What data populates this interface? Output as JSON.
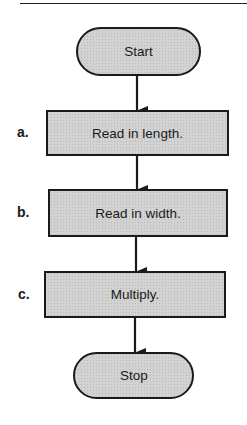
{
  "diagram": {
    "type": "flowchart",
    "colors": {
      "fill": "#cfcfcf",
      "stroke": "#1a1a1a",
      "text": "#1a1a1a"
    },
    "nodes": [
      {
        "id": "start",
        "shape": "terminal",
        "text": "Start"
      },
      {
        "id": "a",
        "shape": "process",
        "label": "a.",
        "text": "Read in length."
      },
      {
        "id": "b",
        "shape": "process",
        "label": "b.",
        "text": "Read in width."
      },
      {
        "id": "c",
        "shape": "process",
        "label": "c.",
        "text": "Multiply."
      },
      {
        "id": "stop",
        "shape": "terminal",
        "text": "Stop"
      }
    ],
    "edges": [
      {
        "from": "start",
        "to": "a"
      },
      {
        "from": "a",
        "to": "b"
      },
      {
        "from": "b",
        "to": "c"
      },
      {
        "from": "c",
        "to": "stop"
      }
    ]
  }
}
